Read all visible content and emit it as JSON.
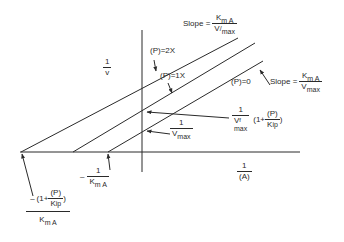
{
  "diagram": {
    "type": "Lineweaver-Burk double reciprocal plot (competitive product inhibition)",
    "axes": {
      "y_label_num": "1",
      "y_label_den": "v",
      "x_label_num": "1",
      "x_label_den": "(A)"
    },
    "lines": [
      {
        "label": "(P)=2X"
      },
      {
        "label": "(P)=1X"
      },
      {
        "label": "(P)=0"
      }
    ],
    "slope_top": {
      "prefix": "Slope =",
      "num_main": "K",
      "num_sub": "m A",
      "den_main": "V",
      "den_sup": "/",
      "den_sub": "max"
    },
    "slope_right": {
      "prefix": "Slope =",
      "num_main": "K",
      "num_sub": "m A",
      "den_main": "V",
      "den_sub": "max"
    },
    "y_intercept_inhibited": {
      "num": "1",
      "den_main": "V",
      "den_sup": "f",
      "den_sub": "max",
      "factor_prefix": "(1+",
      "factor_num": "(P)",
      "factor_den": "K",
      "factor_den_sub": "ip",
      "factor_suffix": ")"
    },
    "y_intercept_uninhibited": {
      "num": "1",
      "den_main": "V",
      "den_sub": "max"
    },
    "x_intercept_uninhibited": {
      "sign": "–",
      "num": "1",
      "den_main": "K",
      "den_sub": "m A"
    },
    "x_intercept_inhibited": {
      "sign": "–",
      "factor_prefix": "(1+",
      "factor_num": "(P)",
      "factor_den": "K",
      "factor_den_sub": "ip",
      "factor_suffix": ")",
      "den_main": "K",
      "den_sub": "m A"
    }
  }
}
